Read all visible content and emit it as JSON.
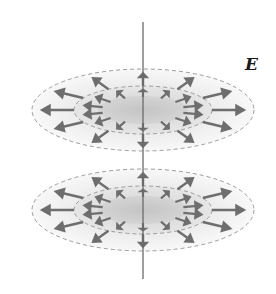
{
  "diagram": {
    "field_label": "E",
    "axis": {
      "x": 143,
      "y1": 22,
      "y2": 279,
      "color": "#6a6a6a"
    },
    "disks": [
      {
        "name": "upper-disk",
        "cy": 110
      },
      {
        "name": "lower-disk",
        "cy": 210
      }
    ],
    "geometry": {
      "cx": 143,
      "outer": {
        "rx": 111,
        "ry": 41
      },
      "middle": {
        "rx": 69,
        "ry": 24
      },
      "core": {
        "rx": 45,
        "ry": 14
      },
      "outer_arrow_count": 12,
      "inner_arrow_count": 14
    },
    "colors": {
      "arrow": "#6e6e6e",
      "dashed_outline": "#9c9c9c",
      "fill_center": "#cfcfcf",
      "fill_mid": "#e4e4e4",
      "fill_edge": "#f7f7f7"
    }
  }
}
